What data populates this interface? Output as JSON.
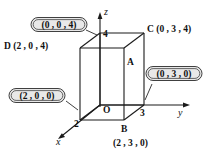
{
  "figure": {
    "background_color": "#ffffff",
    "line_color": "#1a1a1a"
  },
  "axes": [
    {
      "name": "z",
      "label": "z",
      "direction": "up"
    },
    {
      "name": "y",
      "label": "y",
      "direction": "right"
    },
    {
      "name": "x",
      "label": "x",
      "direction": "down-left"
    }
  ],
  "ticks": [
    {
      "axis": "z",
      "label": "4"
    },
    {
      "axis": "y",
      "label": "3"
    },
    {
      "axis": "x",
      "label": "2"
    }
  ],
  "vertices": [
    {
      "id": "O",
      "label": "O",
      "coords": ""
    },
    {
      "id": "A",
      "label": "A",
      "coords": ""
    },
    {
      "id": "B",
      "label": "B",
      "coords": "(2 , 3 , 0)"
    },
    {
      "id": "C",
      "label": "C (0 , 3 , 4)",
      "coords": "(0, 3, 4)"
    },
    {
      "id": "D",
      "label": "D (2 , 0 , 4)",
      "coords": "(2, 0, 4)"
    }
  ],
  "labels": {
    "origin": "O",
    "vertex_a": "A",
    "vertex_b": "B",
    "vertex_b_coords": "(2 , 3 , 0)",
    "vertex_c": "C (0 , 3 , 4)",
    "vertex_d": "D (2 , 0 , 4)"
  },
  "callouts": [
    {
      "id": "z-intercept",
      "text": "(0 , 0 , 4)",
      "fill": "#e8e8e8",
      "border": "#2b2b2b"
    },
    {
      "id": "x-intercept",
      "text": "(2 , 0 , 0)",
      "fill": "#e8e8e8",
      "border": "#2b2b2b"
    },
    {
      "id": "y-intercept",
      "text": "(0 , 3 , 0)",
      "fill": "#e8e8e8",
      "border": "#2b2b2b"
    }
  ]
}
